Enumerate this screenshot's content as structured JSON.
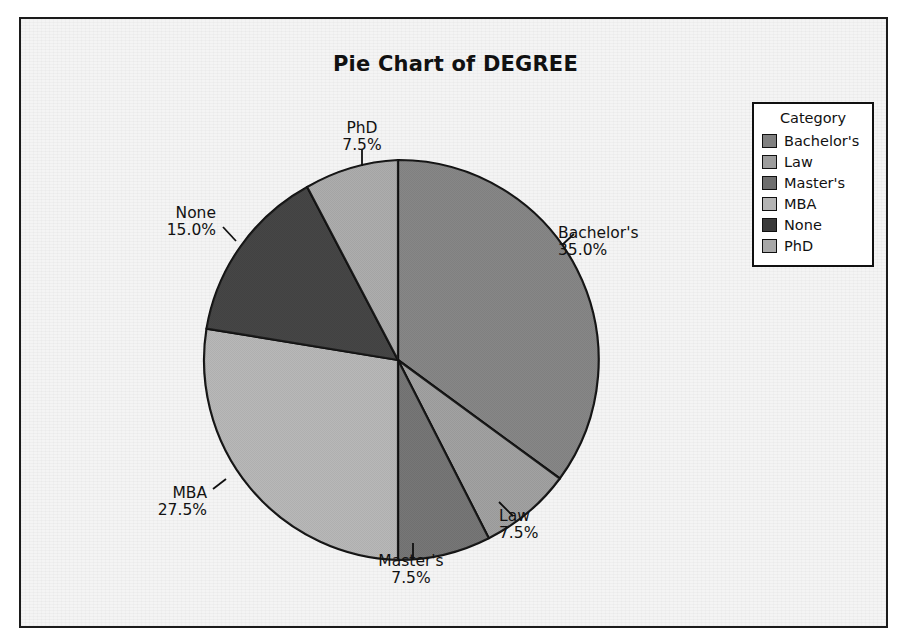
{
  "chart_data": {
    "type": "pie",
    "title": "Pie Chart of DEGREE",
    "legend_title": "Category",
    "legend_position": "right",
    "labels": [
      "Bachelor's",
      "Law",
      "Master's",
      "MBA",
      "None",
      "PhD"
    ],
    "values": [
      35.0,
      7.5,
      7.5,
      27.5,
      15.0,
      7.5
    ],
    "value_labels": [
      "35.0%",
      "7.5%",
      "7.5%",
      "27.5%",
      "15.0%",
      "7.5%"
    ],
    "slice_colors": [
      "#808080",
      "#9c9c9c",
      "#6e6e6e",
      "#b4b4b4",
      "#3a3a3a",
      "#a8a8a8"
    ],
    "legend_order": [
      "Bachelor's",
      "Law",
      "Master's",
      "MBA",
      "None",
      "PhD"
    ],
    "legend_colors": [
      "#808080",
      "#9c9c9c",
      "#6e6e6e",
      "#b4b4b4",
      "#3a3a3a",
      "#a8a8a8"
    ],
    "start_angle_deg": 0,
    "direction": "clockwise",
    "xlabel": "",
    "ylabel": "",
    "grid": false
  },
  "slices": [
    {
      "name": "Bachelor's",
      "pct": "35.0%",
      "color": "#808080"
    },
    {
      "name": "Law",
      "pct": "7.5%",
      "color": "#9c9c9c"
    },
    {
      "name": "Master's",
      "pct": "7.5%",
      "color": "#6e6e6e"
    },
    {
      "name": "MBA",
      "pct": "27.5%",
      "color": "#b4b4b4"
    },
    {
      "name": "None",
      "pct": "15.0%",
      "color": "#3a3a3a"
    },
    {
      "name": "PhD",
      "pct": "7.5%",
      "color": "#a8a8a8"
    }
  ],
  "legend": {
    "title": "Category",
    "items": [
      {
        "label": "Bachelor's",
        "color": "#808080"
      },
      {
        "label": "Law",
        "color": "#9c9c9c"
      },
      {
        "label": "Master's",
        "color": "#6e6e6e"
      },
      {
        "label": "MBA",
        "color": "#b4b4b4"
      },
      {
        "label": "None",
        "color": "#3a3a3a"
      },
      {
        "label": "PhD",
        "color": "#a8a8a8"
      }
    ]
  },
  "style": {
    "outline": "#101010",
    "paper": "#f4f4f4"
  }
}
